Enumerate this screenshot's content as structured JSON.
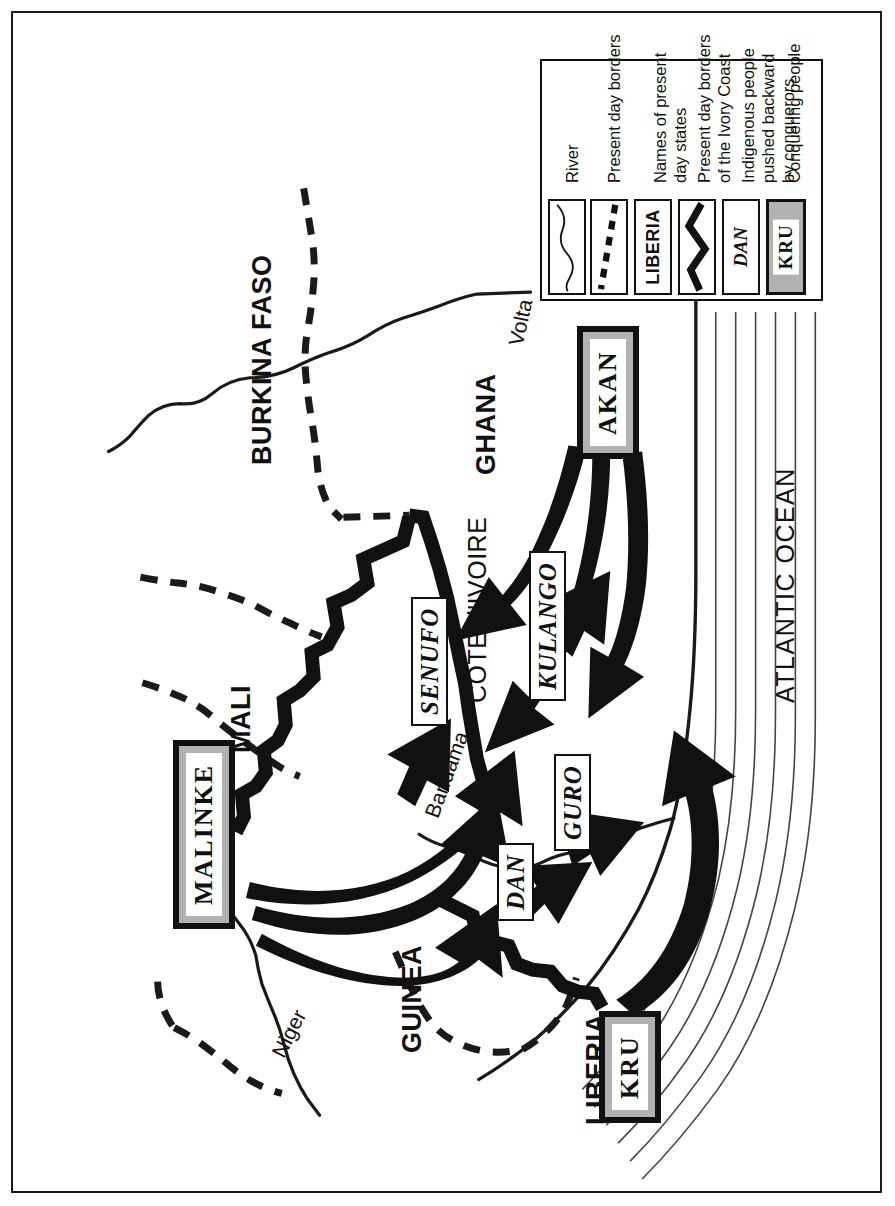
{
  "map": {
    "title": "Migration and conquest map of the Ivory Coast region",
    "orientation": "rotated",
    "countries": [
      {
        "name": "BURKINA FASO"
      },
      {
        "name": "MALI"
      },
      {
        "name": "GHANA"
      },
      {
        "name": "GUINEA"
      },
      {
        "name": "LIBERIA"
      },
      {
        "name": "COTE d'IVOIRE"
      }
    ],
    "ocean": {
      "name": "ATLANTIC OCEAN"
    },
    "rivers": [
      {
        "name": "Volta"
      },
      {
        "name": "Bandama"
      },
      {
        "name": "Niger"
      }
    ],
    "indigenous_peoples": [
      {
        "name": "SENUFO"
      },
      {
        "name": "KULANGO"
      },
      {
        "name": "DAN"
      },
      {
        "name": "GURO"
      }
    ],
    "conquering_peoples": [
      {
        "name": "MALINKE"
      },
      {
        "name": "AKAN"
      },
      {
        "name": "KRU"
      }
    ]
  },
  "legend": {
    "items": [
      {
        "swatch": "river-line",
        "label_line1": "River",
        "label_line2": ""
      },
      {
        "swatch": "dashed-line",
        "label_line1": "Present day borders",
        "label_line2": ""
      },
      {
        "swatch": "LIBERIA",
        "label_line1": "Names of present",
        "label_line2": "day states"
      },
      {
        "swatch": "thick-line",
        "label_line1": "Present day borders",
        "label_line2": "of the Ivory Coast"
      },
      {
        "swatch": "DAN",
        "label_line1": "Indigenous people",
        "label_line2": "pushed backward",
        "label_line3": "by conquerors"
      },
      {
        "swatch": "KRU",
        "label_line1": "Conquering people",
        "label_line2": ""
      }
    ]
  },
  "colors": {
    "ink": "#111111",
    "gray_fill": "#b2b2b2",
    "paper": "#ffffff"
  }
}
